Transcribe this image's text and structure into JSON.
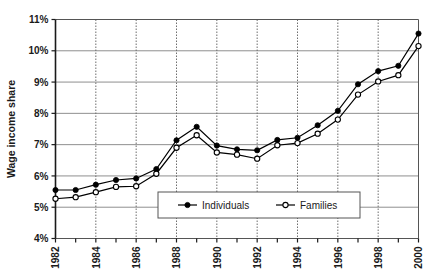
{
  "chart_data": {
    "type": "line",
    "title": "",
    "xlabel": "",
    "ylabel": "Wage income share",
    "x": [
      1982,
      1983,
      1984,
      1985,
      1986,
      1987,
      1988,
      1989,
      1990,
      1991,
      1992,
      1993,
      1994,
      1995,
      1996,
      1997,
      1998,
      1999,
      2000
    ],
    "xtick_labels": [
      "1982",
      "",
      "1984",
      "",
      "1986",
      "",
      "1988",
      "",
      "1990",
      "",
      "1992",
      "",
      "1994",
      "",
      "1996",
      "",
      "1998",
      "",
      "2000"
    ],
    "xtick_labels_shown": [
      "1982",
      "1984",
      "1986",
      "1988",
      "1990",
      "1992",
      "1994",
      "1996",
      "1998",
      "2000"
    ],
    "ytick_labels": [
      "4%",
      "5%",
      "6%",
      "7%",
      "8%",
      "9%",
      "10%",
      "11%"
    ],
    "ytick_values": [
      4,
      5,
      6,
      7,
      8,
      9,
      10,
      11
    ],
    "ylim": [
      4,
      11
    ],
    "xlim": [
      1982,
      2000
    ],
    "grid": "horizontal-solid-and-vertical-dotted",
    "legend_position": "inside-lower-center",
    "series": [
      {
        "name": "Individuals",
        "marker": "filled-circle",
        "color": "#000000",
        "values": [
          5.55,
          5.55,
          5.72,
          5.87,
          5.92,
          6.22,
          7.14,
          7.57,
          6.97,
          6.85,
          6.82,
          7.15,
          7.22,
          7.62,
          8.08,
          8.93,
          9.35,
          9.52,
          10.55
        ]
      },
      {
        "name": "Families",
        "marker": "open-circle",
        "color": "#000000",
        "values": [
          5.27,
          5.32,
          5.48,
          5.65,
          5.67,
          6.07,
          6.9,
          7.3,
          6.75,
          6.68,
          6.55,
          6.98,
          7.05,
          7.35,
          7.8,
          8.6,
          9.02,
          9.22,
          10.15
        ]
      }
    ]
  },
  "legend": {
    "items": [
      {
        "label": "Individuals",
        "marker": "filled-circle"
      },
      {
        "label": "Families",
        "marker": "open-circle"
      }
    ]
  },
  "axes": {
    "y_title": "Wage income share"
  }
}
